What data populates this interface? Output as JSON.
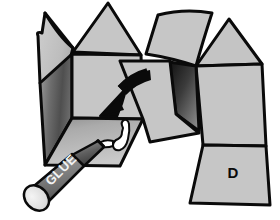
{
  "illustration": {
    "title": "Cardboard box assembly step",
    "subject": "folded-carton-net-with-glue",
    "background_color": "#ffffff",
    "outline_color": "#0a0a0a",
    "panels": [
      {
        "id": "top-left-flap",
        "name": "top-left-flap",
        "label": "",
        "fill": "#c4c4c4",
        "shading": "flat"
      },
      {
        "id": "top-center-gable",
        "name": "top-center-gable-flap",
        "label": "",
        "fill": "#c6c6c6",
        "shading": "flat"
      },
      {
        "id": "top-right-curved-flap",
        "name": "top-right-curved-flap",
        "label": "",
        "fill": "#c6c6c6",
        "shading": "flat"
      },
      {
        "id": "top-right-gable",
        "name": "top-right-gable-flap",
        "label": "",
        "fill": "#c4c4c4",
        "shading": "flat"
      },
      {
        "id": "left-side-panel",
        "name": "left-side-panel-shaded",
        "label": "",
        "fill": "#5a5a5a",
        "shading": "gradient-dark"
      },
      {
        "id": "front-face-panel",
        "name": "front-face-panel",
        "label": "",
        "fill": "#c6c6c6",
        "shading": "flat"
      },
      {
        "id": "bottom-front-panel",
        "name": "bottom-front-panel",
        "label": "",
        "fill": "#bdbdbd",
        "shading": "gradient-light"
      },
      {
        "id": "center-folding-flap",
        "name": "center-folding-flap",
        "label": "",
        "fill": "#c6c6c6",
        "shading": "flat"
      },
      {
        "id": "center-dark-wedge",
        "name": "center-dark-gusset-wedge",
        "label": "",
        "fill": "#2a2a2a",
        "shading": "gradient-dark"
      },
      {
        "id": "right-side-panel",
        "name": "right-side-panel",
        "label": "",
        "fill": "#c6c6c6",
        "shading": "flat"
      },
      {
        "id": "labelled-panel-d",
        "name": "labelled-panel-d",
        "label": "D",
        "fill": "#c6c6c6",
        "shading": "flat"
      }
    ],
    "fold_arrow": {
      "name": "fold-direction-arrow",
      "description": "curved arrow pointing down-left",
      "color": "#0a0a0a",
      "direction": "down-left"
    },
    "glue_stick": {
      "name": "glue-stick",
      "brand_text": "GLUE",
      "body_color": "#8f8f8f",
      "cap_color": "#6e6e6e",
      "end_color": "#e8e8e8",
      "text_color": "#f2f2f2",
      "applied_glue_color": "#ffffff",
      "applied_glue_name": "glue-bead-squiggle"
    },
    "panel_label_d": "D"
  }
}
